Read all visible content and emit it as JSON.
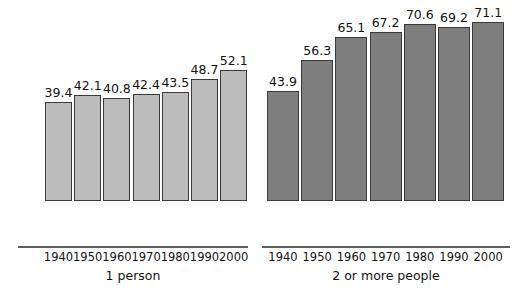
{
  "chart_data": {
    "type": "bar",
    "title": "",
    "subtitle": "",
    "xlabel": "",
    "ylabel": "",
    "ylim": [
      0,
      80
    ],
    "grid": false,
    "legend": "none",
    "categories": [
      "1940",
      "1950",
      "1960",
      "1970",
      "1980",
      "1990",
      "2000"
    ],
    "groups": [
      {
        "name": "1 person",
        "color": "#bcbcbc",
        "values": [
          39.4,
          42.1,
          40.8,
          42.4,
          43.5,
          48.7,
          52.1
        ],
        "labels": [
          "39.4",
          "42.1",
          "40.8",
          "42.4",
          "43.5",
          "48.7",
          "52.1"
        ]
      },
      {
        "name": "2 or more people",
        "color": "#7e7e7e",
        "values": [
          43.9,
          56.3,
          65.1,
          67.2,
          70.6,
          69.2,
          71.1
        ],
        "labels": [
          "43.9",
          "56.3",
          "65.1",
          "67.2",
          "70.6",
          "69.2",
          "71.1"
        ]
      }
    ]
  },
  "groups": {
    "single": {
      "label": "1 person",
      "ticks": [
        "1940",
        "1950",
        "1960",
        "1970",
        "1980",
        "1990",
        "2000"
      ],
      "values": [
        "39.4",
        "42.1",
        "40.8",
        "42.4",
        "43.5",
        "48.7",
        "52.1"
      ]
    },
    "multi": {
      "label": "2 or more people",
      "ticks": [
        "1940",
        "1950",
        "1960",
        "1970",
        "1980",
        "1990",
        "2000"
      ],
      "values": [
        "43.9",
        "56.3",
        "65.1",
        "67.2",
        "70.6",
        "69.2",
        "71.1"
      ]
    }
  },
  "colors": {
    "single_bar": "#bcbcbc",
    "multi_bar": "#7e7e7e",
    "bar_outline": "#3a3a3a",
    "baseline": "#5e5e5e",
    "text": "#121212",
    "background": "#ffffff"
  }
}
